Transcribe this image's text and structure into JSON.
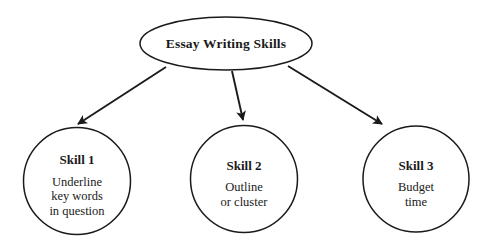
{
  "diagram": {
    "type": "hierarchy-tree",
    "stroke_color": "#1a1a1a",
    "fill_color": "#ffffff",
    "background_color": "#ffffff",
    "root": {
      "shape": "ellipse",
      "title": "Essay Writing Skills"
    },
    "branches": [
      {
        "shape": "circle",
        "title": "Skill 1",
        "lines": [
          "Underline",
          "key words",
          "in question"
        ]
      },
      {
        "shape": "circle",
        "title": "Skill 2",
        "lines": [
          "Outline",
          "or cluster"
        ]
      },
      {
        "shape": "circle",
        "title": "Skill 3",
        "lines": [
          "Budget",
          "time"
        ]
      }
    ],
    "connectors": [
      {
        "from": "root",
        "to": "Skill 1",
        "style": "solid-arrow"
      },
      {
        "from": "root",
        "to": "Skill 2",
        "style": "solid-arrow"
      },
      {
        "from": "root",
        "to": "Skill 3",
        "style": "solid-arrow"
      }
    ]
  }
}
